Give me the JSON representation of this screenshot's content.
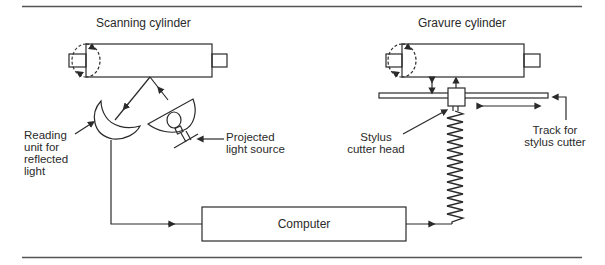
{
  "diagram": {
    "type": "process schematic",
    "components": {
      "scanning_cylinder": {
        "title": "Scanning cylinder"
      },
      "gravure_cylinder": {
        "title": "Gravure cylinder"
      },
      "reading_unit": {
        "label_lines": [
          "Reading",
          "unit for",
          "reflected",
          "light"
        ]
      },
      "light_source": {
        "label_lines": [
          "Projected",
          "light source"
        ]
      },
      "stylus": {
        "label_lines": [
          "Stylus",
          "cutter head"
        ]
      },
      "track": {
        "label_lines": [
          "Track for",
          "stylus cutter"
        ]
      },
      "computer": {
        "label": "Computer"
      }
    },
    "flow": [
      "Projected light source -> Scanning cylinder",
      "Scanning cylinder -> Reading unit for reflected light",
      "Reading unit -> Computer",
      "Computer -> Stylus cutter head (via spring)",
      "Stylus cutter head <-> Gravure cylinder",
      "Stylus cutter head <-> along Track for stylus cutter"
    ],
    "colors": {
      "ink": "#2a2a2a",
      "background": "#ffffff",
      "rule": "#555555"
    }
  }
}
